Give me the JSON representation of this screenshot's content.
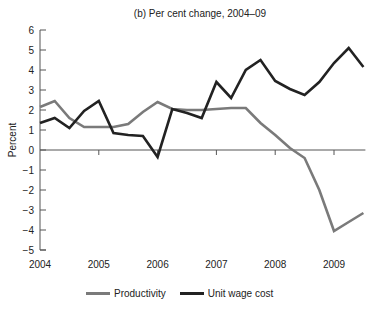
{
  "chart_data": {
    "type": "line",
    "title": "(b) Per cent change, 2004–09",
    "xlabel": "",
    "ylabel": "Percent",
    "ylim": [
      -5,
      6
    ],
    "yticks": [
      6,
      5,
      4,
      3,
      2,
      1,
      0,
      -1,
      -2,
      -3,
      -4,
      -5
    ],
    "xticks": [
      "2004",
      "2005",
      "2006",
      "2007",
      "2008",
      "2009"
    ],
    "x_range": [
      2004.0,
      2009.5
    ],
    "grid": false,
    "legend_position": "bottom",
    "x": [
      2004.0,
      2004.25,
      2004.5,
      2004.75,
      2005.0,
      2005.25,
      2005.5,
      2005.75,
      2006.0,
      2006.25,
      2006.5,
      2006.75,
      2007.0,
      2007.25,
      2007.5,
      2007.75,
      2008.0,
      2008.25,
      2008.5,
      2008.75,
      2009.0,
      2009.25,
      2009.5
    ],
    "series": [
      {
        "name": "Productivity",
        "color": "#7a7a7a",
        "values": [
          2.15,
          2.45,
          1.6,
          1.15,
          1.15,
          1.15,
          1.3,
          1.9,
          2.4,
          2.05,
          2.0,
          2.0,
          2.05,
          2.1,
          2.1,
          1.35,
          0.75,
          0.1,
          -0.4,
          -2.0,
          -4.05,
          -3.6,
          -3.15
        ]
      },
      {
        "name": "Unit wage cost",
        "color": "#222222",
        "values": [
          1.35,
          1.6,
          1.1,
          1.95,
          2.45,
          0.85,
          0.75,
          0.7,
          -0.35,
          2.05,
          1.85,
          1.6,
          3.4,
          2.6,
          4.0,
          4.5,
          3.45,
          3.05,
          2.75,
          3.4,
          4.35,
          5.1,
          4.15
        ]
      }
    ]
  },
  "legend": {
    "items": [
      {
        "label": "Productivity",
        "color": "#7a7a7a"
      },
      {
        "label": "Unit wage cost",
        "color": "#222222"
      }
    ]
  }
}
